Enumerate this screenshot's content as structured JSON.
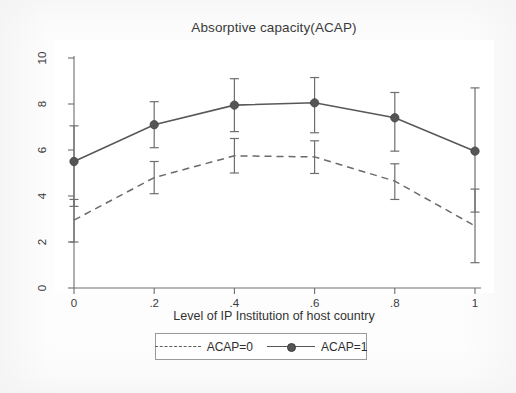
{
  "chart_data": {
    "type": "line",
    "title": "Absorptive capacity(ACAP)",
    "xlabel": "Level of IP Institution of host country",
    "ylabel": "",
    "x": [
      0,
      0.2,
      0.4,
      0.6,
      0.8,
      1
    ],
    "xtick_labels": [
      "0",
      ".2",
      ".4",
      ".6",
      ".8",
      "1"
    ],
    "ytick_labels": [
      "0",
      "2",
      "4",
      "6",
      "8",
      "10"
    ],
    "yticks": [
      0,
      2,
      4,
      6,
      8,
      10
    ],
    "xlim": [
      0,
      1
    ],
    "ylim": [
      0,
      10
    ],
    "grid": false,
    "legend_position": "below-axis",
    "series": [
      {
        "name": "ACAP=0",
        "style": "dashed",
        "marker": "none",
        "color": "#6a6a6a",
        "values": [
          2.95,
          4.8,
          5.75,
          5.7,
          4.65,
          2.7
        ],
        "ci_low": [
          2.0,
          4.1,
          5.0,
          4.98,
          3.85,
          1.1
        ],
        "ci_high": [
          3.85,
          5.5,
          6.5,
          6.4,
          5.4,
          4.3
        ]
      },
      {
        "name": "ACAP=1",
        "style": "solid",
        "marker": "circle",
        "color": "#585858",
        "values": [
          5.5,
          7.1,
          7.95,
          8.05,
          7.4,
          5.95
        ],
        "ci_low": [
          3.55,
          6.1,
          6.8,
          6.75,
          5.95,
          3.3
        ],
        "ci_high": [
          7.05,
          8.1,
          9.1,
          9.15,
          8.5,
          8.7
        ]
      }
    ]
  },
  "legend": {
    "entries": [
      {
        "label": "ACAP=0"
      },
      {
        "label": "ACAP=1"
      }
    ]
  }
}
